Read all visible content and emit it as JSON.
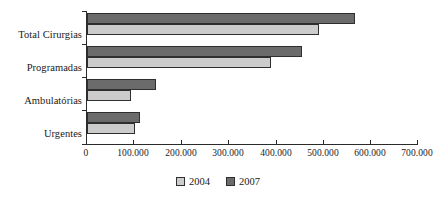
{
  "chart_data": {
    "type": "bar",
    "orientation": "horizontal",
    "title": "",
    "xlabel": "",
    "ylabel": "",
    "categories": [
      "Total Cirurgias",
      "Programadas",
      "Ambulatórias",
      "Urgentes"
    ],
    "series": [
      {
        "name": "2004",
        "color": "#cccccc",
        "values": [
          491000,
          389000,
          94000,
          102000
        ]
      },
      {
        "name": "2007",
        "color": "#6b6b6b",
        "values": [
          566000,
          455000,
          145000,
          113000
        ]
      }
    ],
    "series_draw_order": [
      "2007",
      "2004"
    ],
    "xlim": [
      0,
      700000
    ],
    "xticks": [
      0,
      100000,
      200000,
      300000,
      400000,
      500000,
      600000,
      700000
    ],
    "xtick_labels": [
      "0",
      "100.000",
      "200.000",
      "300.000",
      "400.000",
      "500.000",
      "600.000",
      "700.000"
    ],
    "grid": false,
    "legend_position": "bottom-center",
    "legend_entries": [
      "2004",
      "2007"
    ]
  }
}
